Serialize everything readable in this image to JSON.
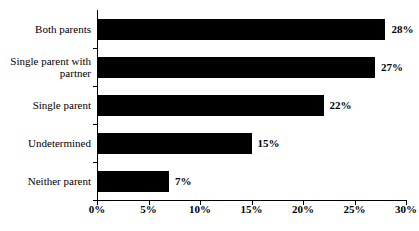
{
  "chart_data": {
    "type": "bar",
    "orientation": "horizontal",
    "title": "",
    "subtitle": "",
    "xlabel": "",
    "ylabel": "",
    "categories": [
      "Both parents",
      "Single parent with partner",
      "Single parent",
      "Undetermined",
      "Neither parent"
    ],
    "values": [
      28,
      27,
      22,
      15,
      7
    ],
    "value_labels": [
      "28%",
      "27%",
      "22%",
      "15%",
      "7%"
    ],
    "xlim": [
      0,
      30
    ],
    "xticks": [
      0,
      5,
      10,
      15,
      20,
      25,
      30
    ],
    "xtick_labels": [
      "0%",
      "5%",
      "10%",
      "15%",
      "20%",
      "25%",
      "30%"
    ],
    "grid": false,
    "legend": null,
    "bar_color": "#000000",
    "axis_color": "#000000",
    "background_color": "#ffffff"
  }
}
